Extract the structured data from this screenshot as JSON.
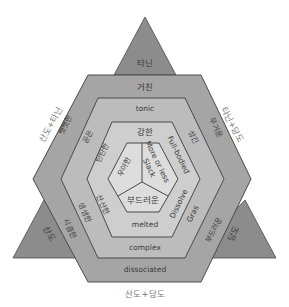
{
  "diagram": {
    "colors": {
      "triangle": "#8c8c8c",
      "ring1": "#a5a5a5",
      "ring2": "#bcbcbc",
      "ring3": "#cecece",
      "core": "#dddddd",
      "stroke": "#4a4a4a",
      "text": "#3a3a3a"
    },
    "triangles": {
      "top": "타닌",
      "bottom_left": "산도",
      "bottom_right": "당도"
    },
    "outside_labels": {
      "left": "산도+타닌",
      "right": "타닌+당도",
      "bottom": "산도+당도"
    },
    "ring1": {
      "top": "거친",
      "upper_left": "뻣뻣한",
      "upper_right": "무거운",
      "lower_left": "시큼한",
      "lower_right": "부드러운",
      "bottom": "dissociated"
    },
    "ring2": {
      "top": "tonic",
      "upper_left": "곧은",
      "upper_right": "성긴",
      "lower_left": "생생한",
      "lower_right": "Gras",
      "bottom": "complex"
    },
    "ring3": {
      "top": "강한",
      "upper_left": "탄탄한",
      "upper_right": "Full-bodied",
      "lower_left": "산산한",
      "lower_right": "Dissolve",
      "bottom": "melted"
    },
    "core": {
      "left": "우아한",
      "right_line1": "More or less",
      "right_line2": "Slack",
      "bottom": "부드러운"
    }
  }
}
